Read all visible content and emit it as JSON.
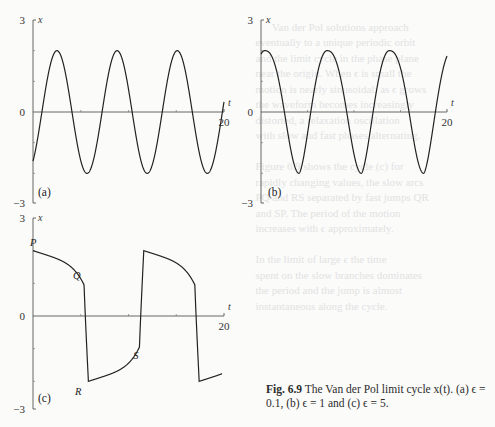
{
  "caption": {
    "label": "Fig. 6.9",
    "text": "The Van der Pol limit cycle x(t). (a) ϵ = 0.1, (b) ϵ = 1 and (c) ϵ = 5."
  },
  "chart_data": [
    {
      "type": "line",
      "panel": "(a)",
      "title": "Van der Pol limit cycle, ϵ = 0.1",
      "xlabel": "t",
      "ylabel": "x",
      "xlim": [
        0,
        20
      ],
      "ylim": [
        -3,
        3
      ],
      "yticks": [
        "3",
        "0",
        "−3"
      ],
      "xticks": [
        "20"
      ],
      "grid": false,
      "series": [
        {
          "name": "x(t)",
          "epsilon": 0.1,
          "amplitude": 2.0,
          "period": 6.3,
          "x": [
            0,
            0.8,
            1.6,
            3.2,
            4.8,
            6.4,
            8.0,
            9.5,
            11.1,
            12.7,
            14.3,
            15.8,
            17.4,
            19.0,
            20
          ],
          "y": [
            -1.6,
            0.5,
            2.0,
            0.0,
            -2.0,
            0.0,
            2.0,
            0.0,
            -2.0,
            0.0,
            2.0,
            0.0,
            -2.0,
            0.0,
            1.0
          ]
        }
      ]
    },
    {
      "type": "line",
      "panel": "(b)",
      "title": "Van der Pol limit cycle, ϵ = 1",
      "xlabel": "t",
      "ylabel": "x",
      "xlim": [
        0,
        20
      ],
      "ylim": [
        -3,
        3
      ],
      "yticks": [
        "3",
        "0",
        "−3"
      ],
      "xticks": [
        "20"
      ],
      "grid": false,
      "series": [
        {
          "name": "x(t)",
          "epsilon": 1,
          "amplitude": 2.0,
          "period": 6.7,
          "x": [
            0,
            0.5,
            3.3,
            4.0,
            5.3,
            6.7,
            7.2,
            9.9,
            10.7,
            12.0,
            13.4,
            13.9,
            16.6,
            17.3,
            18.7,
            20
          ],
          "y": [
            2.0,
            2.0,
            0.0,
            -2.0,
            0.0,
            2.0,
            2.0,
            0.0,
            -2.0,
            0.0,
            2.0,
            2.0,
            0.0,
            -2.0,
            0.0,
            2.0
          ]
        }
      ]
    },
    {
      "type": "line",
      "panel": "(c)",
      "title": "Van der Pol limit cycle, ϵ = 5",
      "xlabel": "t",
      "ylabel": "x",
      "xlim": [
        0,
        20
      ],
      "ylim": [
        -3,
        3
      ],
      "yticks": [
        "3",
        "0",
        "−3"
      ],
      "xticks": [
        "20"
      ],
      "grid": false,
      "annotations": [
        "P",
        "Q",
        "R",
        "S"
      ],
      "series": [
        {
          "name": "x(t)",
          "epsilon": 5,
          "amplitude": 2.0,
          "period": 11.5,
          "x": [
            0,
            3.0,
            5.2,
            5.8,
            6.0,
            9.5,
            11.2,
            11.8,
            14.8,
            16.8,
            17.4,
            17.6,
            20
          ],
          "y": [
            2.0,
            1.5,
            0.5,
            -1.9,
            -2.0,
            -1.2,
            0.5,
            2.0,
            1.5,
            0.5,
            -1.9,
            -2.0,
            -1.6
          ]
        }
      ]
    }
  ]
}
